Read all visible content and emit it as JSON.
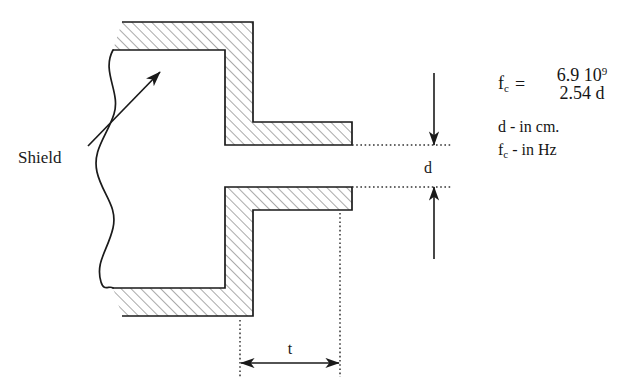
{
  "diagram": {
    "labels": {
      "shield": "Shield",
      "gap_dimension": "d",
      "thickness_dimension": "t"
    },
    "colors": {
      "line": "#1a1a1a",
      "hatch": "#555555",
      "background": "#ffffff",
      "dotted": "#333333"
    }
  },
  "formula": {
    "lhs_symbol": "f",
    "lhs_subscript": "c",
    "equals": "=",
    "numerator": "6.9 10",
    "numerator_exponent": "9",
    "denominator": "2.54 d",
    "units": [
      "d - in cm.",
      "f_c - in Hz"
    ],
    "unit_d": "d - in cm.",
    "unit_fc_symbol": "f",
    "unit_fc_subscript": "c",
    "unit_fc_rest": " - in Hz"
  }
}
